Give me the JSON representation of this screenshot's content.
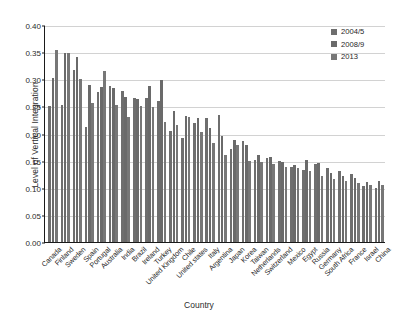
{
  "chart_data": {
    "type": "bar",
    "title": "",
    "xlabel": "Country",
    "ylabel": "Level of Vertical Integration",
    "ylim": [
      0.0,
      0.4
    ],
    "yticks": [
      "0.00",
      "0.05",
      "0.10",
      "0.15",
      "0.20",
      "0.25",
      "0.30",
      "0.35",
      "0.40"
    ],
    "grid": true,
    "legend_position": "top-right",
    "categories": [
      "Canada",
      "Finland",
      "Sweden",
      "Spain",
      "Portugal",
      "Australia",
      "India",
      "Brazil",
      "Ireland",
      "Turkey",
      "United Kingdom",
      "Chile",
      "United states",
      "Italy",
      "Argentina",
      "Japan",
      "Korea",
      "Taiwan",
      "Netherlands",
      "Switzerland",
      "Mexico",
      "Egypt",
      "Russia",
      "Germany",
      "South Africa",
      "France",
      "Israel",
      "China"
    ],
    "series": [
      {
        "name": "2004/5",
        "color": "#6e6e6e",
        "values": [
          0.251,
          0.253,
          0.318,
          0.212,
          0.277,
          0.287,
          0.279,
          0.265,
          0.265,
          0.26,
          0.204,
          0.192,
          0.22,
          0.228,
          0.235,
          0.172,
          0.186,
          0.152,
          0.155,
          0.15,
          0.139,
          0.132,
          0.143,
          0.136,
          0.13,
          0.126,
          0.103,
          0.1
        ]
      },
      {
        "name": "2008/9",
        "color": "#6a6a6a",
        "values": [
          0.303,
          0.349,
          0.341,
          0.289,
          0.286,
          0.284,
          0.268,
          0.263,
          0.288,
          0.298,
          0.241,
          0.233,
          0.228,
          0.21,
          0.196,
          0.188,
          0.178,
          0.16,
          0.156,
          0.147,
          0.142,
          0.152,
          0.145,
          0.128,
          0.121,
          0.118,
          0.11,
          0.112
        ]
      },
      {
        "name": "2013",
        "color": "#777777",
        "values": [
          0.354,
          0.348,
          0.3,
          0.257,
          0.315,
          0.253,
          0.231,
          0.25,
          0.249,
          0.221,
          0.215,
          0.23,
          0.203,
          0.182,
          0.16,
          0.179,
          0.15,
          0.148,
          0.143,
          0.139,
          0.136,
          0.13,
          0.121,
          0.116,
          0.112,
          0.108,
          0.106,
          0.105
        ]
      }
    ]
  },
  "legend": {
    "items": [
      {
        "label": "2004/5"
      },
      {
        "label": "2008/9"
      },
      {
        "label": "2013"
      }
    ]
  }
}
